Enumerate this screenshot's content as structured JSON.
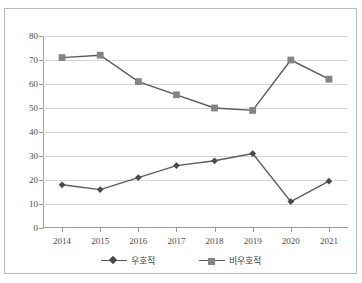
{
  "topnote": {
    "text": ""
  },
  "chart_data": {
    "type": "line",
    "title": "",
    "xlabel": "",
    "ylabel": "",
    "categories": [
      "2014",
      "2015",
      "2016",
      "2017",
      "2018",
      "2019",
      "2020",
      "2021"
    ],
    "series": [
      {
        "name": "우호적",
        "marker": "diamond",
        "color": "#4a4a4a",
        "values": [
          18,
          16,
          21,
          26,
          28,
          31,
          11,
          19.5
        ]
      },
      {
        "name": "비우호적",
        "marker": "square",
        "color": "#848484",
        "values": [
          71,
          72,
          61,
          55.5,
          50,
          49,
          70,
          62
        ]
      }
    ],
    "ylim": [
      0,
      80
    ],
    "yticks": [
      0,
      10,
      20,
      30,
      40,
      50,
      60,
      70,
      80
    ],
    "ytick_labels": [
      "0",
      "10",
      "20",
      "30",
      "40",
      "50",
      "60",
      "70",
      "80"
    ],
    "grid": true,
    "legend_position": "bottom",
    "line_color": "#5a5a5a",
    "grid_color": "#d6d6d6",
    "axis_color": "#9a9a9a",
    "frame_color": "#b9b9b9"
  }
}
